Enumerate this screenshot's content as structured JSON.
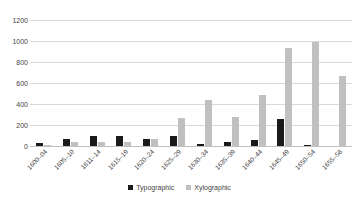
{
  "chart_data": {
    "type": "bar",
    "title": "",
    "xlabel": "",
    "ylabel": "",
    "ylim": [
      0,
      1200
    ],
    "yticks": [
      0,
      200,
      400,
      600,
      800,
      1000,
      1200
    ],
    "grid": true,
    "legend_position": "bottom",
    "categories": [
      "1600–04",
      "1605–10",
      "1611–14",
      "1615–19",
      "1620–24",
      "1625–29",
      "1630–34",
      "1635–39",
      "1640–44",
      "1645–49",
      "1650–54",
      "1655–58"
    ],
    "series": [
      {
        "name": "Typographic",
        "color": "#1a1a1a",
        "values": [
          30,
          70,
          95,
          100,
          70,
          100,
          20,
          40,
          60,
          255,
          10,
          0
        ]
      },
      {
        "name": "Xylographic",
        "color": "#c0c0c0",
        "values": [
          10,
          35,
          40,
          40,
          65,
          270,
          440,
          275,
          490,
          930,
          990,
          665
        ]
      }
    ]
  },
  "axes": {
    "y_tick_labels": [
      "1200",
      "1000",
      "800",
      "600",
      "400",
      "200",
      "0"
    ]
  },
  "legend": {
    "items": [
      {
        "label": "Typographic",
        "swatch": "legend-swatch-typographic"
      },
      {
        "label": "Xylographic",
        "swatch": "legend-swatch-xylographic"
      }
    ]
  },
  "colors": {
    "typographic": "#1a1a1a",
    "xylographic": "#c0c0c0",
    "gridline": "#d9d9d9",
    "text": "#3f3f3f",
    "background": "#ffffff"
  }
}
